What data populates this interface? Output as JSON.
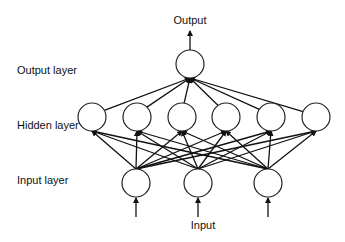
{
  "diagram": {
    "type": "feedforward-neural-network",
    "labels": {
      "output_top": "Output",
      "output_layer": "Output layer",
      "hidden_layer": "Hidden layer",
      "input_layer": "Input layer",
      "input_bottom": "Input"
    },
    "layers": {
      "input": {
        "count": 3,
        "y": 183,
        "x": [
          136,
          198,
          268
        ]
      },
      "hidden": {
        "count": 6,
        "y": 117,
        "x": [
          92,
          137,
          182,
          226,
          271,
          316
        ]
      },
      "output": {
        "count": 1,
        "y": 64,
        "x": [
          190
        ]
      }
    },
    "node_radius": 14,
    "connections": "fully-connected input->hidden, hidden->output",
    "colors": {
      "stroke": "#111111",
      "fill": "#ffffff",
      "background": "#ffffff"
    }
  }
}
